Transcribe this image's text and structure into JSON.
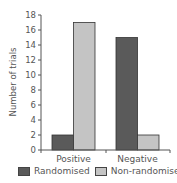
{
  "chart_data": {
    "type": "bar",
    "title": "",
    "xlabel": "",
    "ylabel": "Number of trials",
    "categories": [
      "Positive",
      "Negative"
    ],
    "series": [
      {
        "name": "Randomised",
        "values": [
          2,
          15
        ],
        "color": "#5a5a5a"
      },
      {
        "name": "Non-randomised",
        "values": [
          17,
          2
        ],
        "color": "#c4c4c4"
      }
    ],
    "ylim": [
      0,
      18
    ],
    "yticks": [
      0,
      2,
      4,
      6,
      8,
      10,
      12,
      14,
      16,
      18
    ],
    "grid": false,
    "legend_position": "bottom"
  }
}
